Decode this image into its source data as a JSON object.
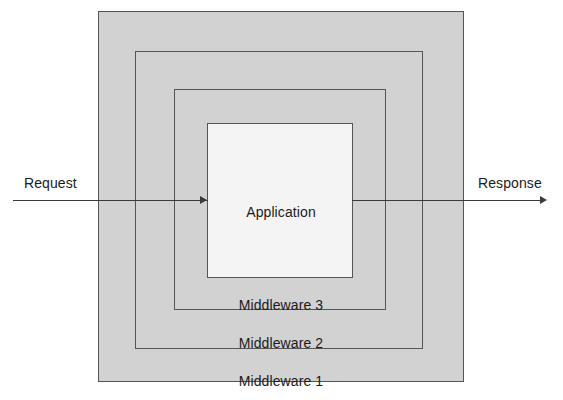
{
  "diagram": {
    "layers": [
      {
        "id": "middleware-1",
        "label": "Middleware 1",
        "fill": "#d2d2d2",
        "stroke": "#555555"
      },
      {
        "id": "middleware-2",
        "label": "Middleware 2",
        "fill": "#d2d2d2",
        "stroke": "#555555"
      },
      {
        "id": "middleware-3",
        "label": "Middleware 3",
        "fill": "#d2d2d2",
        "stroke": "#555555"
      },
      {
        "id": "application",
        "label": "Application",
        "fill": "#f4f4f4",
        "stroke": "#555555"
      }
    ],
    "flow": {
      "request_label": "Request",
      "response_label": "Response",
      "line_color": "#3a3a3a"
    }
  }
}
